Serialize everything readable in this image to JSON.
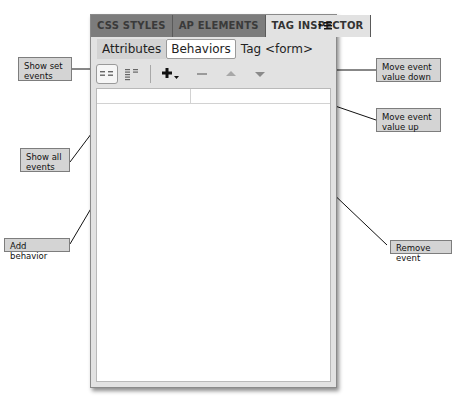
{
  "panel": {
    "tabs": [
      {
        "label": "CSS STYLES",
        "active": false
      },
      {
        "label": "AP ELEMENTS",
        "active": false
      },
      {
        "label": "TAG INSPECTOR",
        "active": true
      }
    ],
    "menu_icon": "panel-options-menu-icon",
    "subtabs": [
      {
        "label": "Attributes",
        "selected": false
      },
      {
        "label": "Behaviors",
        "selected": true
      }
    ],
    "tag_label": "Tag <form>",
    "toolbar": {
      "show_set_events": {
        "icon": "show-set-events-icon",
        "pressed": true
      },
      "show_all_events": {
        "icon": "show-all-events-icon",
        "pressed": false
      },
      "add_behavior": {
        "icon": "plus-dropdown-icon"
      },
      "remove_event": {
        "icon": "minus-icon"
      },
      "move_up": {
        "icon": "triangle-up-icon"
      },
      "move_down": {
        "icon": "triangle-down-icon"
      }
    }
  },
  "callouts": {
    "show_set_events": "Show set events",
    "show_all_events": "Show all events",
    "add_behavior": "Add behavior",
    "move_down": "Move event value down",
    "move_up": "Move event value up",
    "remove_event": "Remove event"
  },
  "colors": {
    "tab_bar": "#6a6a6a",
    "panel_bg": "#e2e2e2",
    "callout_bg": "#d4d4d4"
  }
}
